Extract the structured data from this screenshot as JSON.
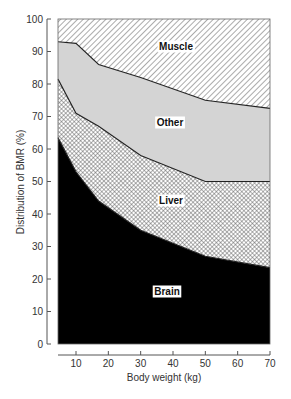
{
  "chart_data": {
    "type": "area",
    "stacked": true,
    "title": "",
    "xlabel": "Body weight (kg)",
    "ylabel": "Distribution of BMR (%)",
    "xlim": [
      4.5,
      70
    ],
    "ylim": [
      0,
      100
    ],
    "x_ticks": [
      10,
      20,
      30,
      40,
      50,
      60,
      70
    ],
    "y_ticks": [
      0,
      10,
      20,
      30,
      40,
      50,
      60,
      70,
      80,
      90,
      100
    ],
    "grid": false,
    "legend": "in-plot region labels",
    "x": [
      4.5,
      10,
      17,
      30,
      50,
      70
    ],
    "cumulative_boundaries": [
      {
        "name": "Brain",
        "upper": [
          63.5,
          53,
          44,
          35,
          27,
          23.5
        ]
      },
      {
        "name": "Liver",
        "upper": [
          81.5,
          71,
          67,
          58,
          50,
          50
        ]
      },
      {
        "name": "Other",
        "upper": [
          93,
          92.5,
          86,
          82,
          75,
          72.5
        ]
      },
      {
        "name": "Muscle",
        "upper": [
          100,
          100,
          100,
          100,
          100,
          100
        ]
      }
    ],
    "series": [
      {
        "name": "Brain",
        "fill": "solid black",
        "values": [
          63.5,
          53,
          44,
          35,
          27,
          23.5
        ]
      },
      {
        "name": "Liver",
        "fill": "cross-hatch",
        "values": [
          18,
          18,
          23,
          23,
          23,
          26.5
        ]
      },
      {
        "name": "Other",
        "fill": "light gray",
        "values": [
          11.5,
          21.5,
          19,
          24,
          25,
          22.5
        ]
      },
      {
        "name": "Muscle",
        "fill": "diagonal hatch",
        "values": [
          7,
          7.5,
          14,
          18,
          25,
          27.5
        ]
      }
    ],
    "region_labels": [
      {
        "text": "Muscle",
        "x": 40,
        "y": 95
      },
      {
        "text": "Other",
        "x": 40,
        "y": 67
      },
      {
        "text": "Liver",
        "x": 40,
        "y": 51
      },
      {
        "text": "Brain",
        "x": 40,
        "y": 17
      }
    ]
  },
  "labels": {
    "muscle": "Muscle",
    "other": "Other",
    "liver": "Liver",
    "brain": "Brain",
    "xlabel": "Body weight (kg)",
    "ylabel": "Distribution of BMR (%)",
    "y_ticks": [
      "0",
      "10",
      "20",
      "30",
      "40",
      "50",
      "60",
      "70",
      "80",
      "90",
      "100"
    ],
    "x_ticks": [
      "10",
      "20",
      "30",
      "40",
      "50",
      "60",
      "70"
    ]
  },
  "colors": {
    "brain": "#000000",
    "other": "#d4d4d4",
    "hatch": "#555555",
    "axis": "#555555"
  }
}
